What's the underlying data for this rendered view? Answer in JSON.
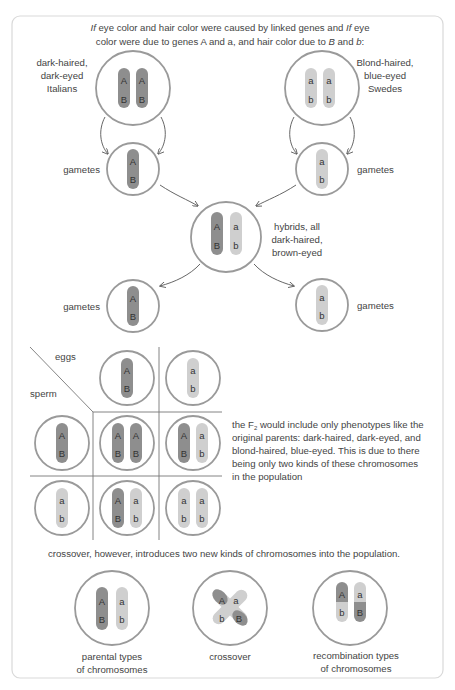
{
  "title": {
    "line1_parts": [
      "If",
      " eye color and hair color were caused by linked genes and ",
      "If",
      " eye"
    ],
    "line2_parts": [
      "color were due to genes A and a, and hair color due to ",
      "B",
      " and ",
      "b",
      ":"
    ]
  },
  "parents": {
    "left_label": [
      "dark-haired,",
      "dark-eyed",
      "Italians"
    ],
    "right_label": [
      "Blond-haired,",
      "blue-eyed",
      "Swedes"
    ]
  },
  "gametes_label": "gametes",
  "hybrid_label": [
    "hybrids, all",
    "dark-haired,",
    "brown-eyed"
  ],
  "punnett": {
    "eggs_label": "eggs",
    "sperm_label": "sperm"
  },
  "alleles": {
    "A": "A",
    "a": "a",
    "B": "B",
    "b": "b"
  },
  "f2_text": {
    "prefix": "the F",
    "subscript": "2",
    "line1_rest": " would include only phenotypes like the",
    "line2": "original parents: dark-haired, dark-eyed, and",
    "line3": "blond-haired, blue-eyed. This is due to there",
    "line4": "being only two kinds of these chromosomes",
    "line5": "in the population"
  },
  "crossover_text": "crossover, however, introduces two new kinds of chromosomes into the population.",
  "bottom_labels": {
    "parental": [
      "parental types",
      "of chromosomes"
    ],
    "crossover": "crossover",
    "recombination": [
      "recombination types",
      "of chromosomes"
    ]
  },
  "colors": {
    "dominant_chromosome": "#8e8e8e",
    "recessive_chromosome": "#cfcfcf",
    "cell_outline": "#9a9a9a",
    "frame_border": "#d9d9d9"
  }
}
